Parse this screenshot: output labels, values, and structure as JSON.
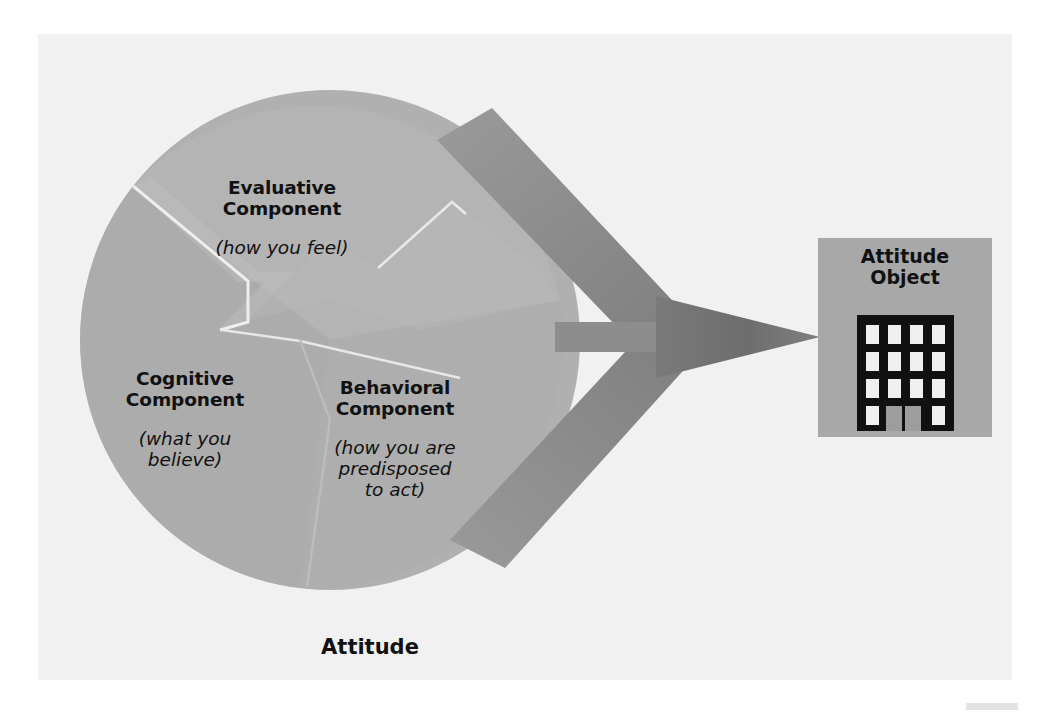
{
  "page": {
    "background_color": "#ffffff",
    "content_background_color": "#f1f1f1"
  },
  "diagram": {
    "title": "Attitude",
    "type": "three-component model of attitude",
    "circle": {
      "label": "Attitude",
      "fill_color": "#b0b0b0",
      "divider_color": "#f2f2f2",
      "center_x": 330,
      "center_y": 340,
      "radius": 250
    },
    "components": [
      {
        "id": "evaluative",
        "heading": "Evaluative\nComponent",
        "subtext": "(how you feel)",
        "wedge_fill": "#b2b2b2"
      },
      {
        "id": "cognitive",
        "heading": "Cognitive\nComponent",
        "subtext": "(what you\nbelieve)",
        "wedge_fill": "#adadad"
      },
      {
        "id": "behavioral",
        "heading": "Behavioral\nComponent",
        "subtext": "(how you are\npredisposed\nto act)",
        "wedge_fill": "#b0b0b0"
      }
    ],
    "arrow": {
      "band_color": "#8d8d8d",
      "head_color": "#6d6d6d",
      "direction": "right",
      "band_count": 3,
      "points_to": "Attitude Object"
    },
    "attitude_object": {
      "heading": "Attitude\nObject",
      "box_fill": "#a8a8a8",
      "icon_name": "office-building-icon",
      "icon_body_color": "#111111",
      "icon_window_color": "#f0f0f0",
      "icon_door_color": "#9a9a9a",
      "window_rows": 4,
      "window_cols": 4,
      "box": {
        "x": 818,
        "y": 238,
        "width": 174,
        "height": 199
      }
    }
  }
}
